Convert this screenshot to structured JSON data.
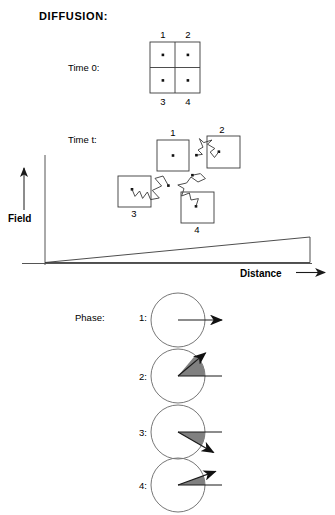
{
  "title": "DIFFUSION:",
  "labels": {
    "time0": "Time 0:",
    "timet": "Time t:",
    "phase": "Phase:",
    "field_axis": "Field",
    "distance_axis": "Distance"
  },
  "grid_time0": {
    "cells": [
      {
        "id": "1",
        "label": "1",
        "label_position": "top",
        "dot": true
      },
      {
        "id": "2",
        "label": "2",
        "label_position": "top",
        "dot": true
      },
      {
        "id": "3",
        "label": "3",
        "label_position": "bottom",
        "dot": true
      },
      {
        "id": "4",
        "label": "4",
        "label_position": "bottom",
        "dot": true
      }
    ]
  },
  "grid_timet": {
    "boxes": [
      {
        "id": "1",
        "label": "1",
        "label_position": "top",
        "has_walk": false
      },
      {
        "id": "2",
        "label": "2",
        "label_position": "top",
        "has_walk": true
      },
      {
        "id": "3",
        "label": "3",
        "label_position": "bottom",
        "has_walk": true
      },
      {
        "id": "4",
        "label": "4",
        "label_position": "bottom",
        "has_walk": true
      }
    ]
  },
  "phases": [
    {
      "id": "1",
      "label": "1:",
      "wedge_degrees": 0,
      "shaded": false,
      "arrow_degrees": 0,
      "arrow_direction": "right"
    },
    {
      "id": "2",
      "label": "2:",
      "wedge_degrees": 50,
      "shaded": true,
      "arrow_degrees": 50,
      "arrow_direction": "up-right"
    },
    {
      "id": "3",
      "label": "3:",
      "wedge_degrees": -30,
      "shaded": true,
      "arrow_degrees": -30,
      "arrow_direction": "down-right"
    },
    {
      "id": "4",
      "label": "4:",
      "wedge_degrees": 20,
      "shaded": true,
      "arrow_degrees": 20,
      "arrow_direction": "up-right"
    }
  ],
  "colors": {
    "ink": "#1a1a1a",
    "line": "#555555",
    "wedge_fill": "#808080",
    "background": "#ffffff"
  }
}
